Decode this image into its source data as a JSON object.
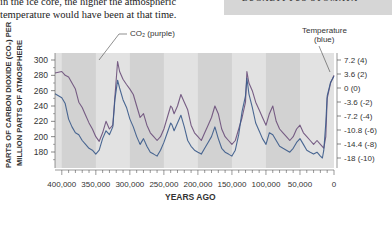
{
  "caption": {
    "line1": "in the ice core, the higher the atmospheric",
    "line2": "temperature would have been at that time."
  },
  "sidebar_label": "EUCALYPTUS STOMATA",
  "chart_data": {
    "type": "line",
    "title": "",
    "xlabel": "YEARS AGO",
    "ylabel": "PARTS OF CARBON DIOXIDE (CO2) PER MILLION PARTS OF ATMOSPHERE",
    "ylabel_line1": "PARTS OF CARBON DIOXIDE (CO₂) PER",
    "ylabel_line2": "MILLION PARTS OF ATMOSPHERE",
    "x_ticks": [
      "400,000",
      "350,000",
      "300,000",
      "250,000",
      "200,000",
      "150,000",
      "100,000",
      "50,000",
      "0"
    ],
    "x_range": [
      410000,
      0
    ],
    "y_left_ticks": [
      "300",
      "280",
      "260",
      "240",
      "220",
      "200",
      "180"
    ],
    "y_left_range": [
      177,
      303
    ],
    "y_right_ticks": [
      "7.2 (4)",
      "3.6 (2)",
      "0 (0)",
      "-3.6 (-2)",
      "-7.2 (-4)",
      "-10.8 (-6)",
      "-14.4 (-8)",
      "-18 (-10)"
    ],
    "y_right_label": "Temperature change °F (°C)",
    "grid": false,
    "background_bands": "alternating gray vertical bands every 50,000 years",
    "annotations": [
      {
        "text": "CO₂ (purple)",
        "points_to_x": 325000,
        "points_to_y": 300
      },
      {
        "text": "Temperature",
        "text2": "(blue)",
        "points_to_x": 5000,
        "points_to_y": 3.0
      }
    ],
    "series": [
      {
        "name": "CO2 (purple)",
        "axis": "left",
        "color": "#6b4f7a",
        "x": [
          410000,
          400000,
          395000,
          390000,
          385000,
          380000,
          375000,
          370000,
          365000,
          360000,
          355000,
          350000,
          345000,
          340000,
          335000,
          330000,
          325000,
          322000,
          318000,
          315000,
          310000,
          305000,
          300000,
          295000,
          290000,
          285000,
          280000,
          275000,
          270000,
          265000,
          260000,
          255000,
          250000,
          245000,
          240000,
          238000,
          235000,
          230000,
          225000,
          220000,
          215000,
          210000,
          205000,
          200000,
          195000,
          190000,
          185000,
          180000,
          175000,
          170000,
          165000,
          160000,
          155000,
          150000,
          145000,
          140000,
          135000,
          130000,
          128000,
          125000,
          120000,
          115000,
          110000,
          105000,
          100000,
          95000,
          90000,
          85000,
          80000,
          75000,
          70000,
          65000,
          60000,
          55000,
          50000,
          45000,
          40000,
          35000,
          30000,
          25000,
          20000,
          17000,
          15000,
          12000,
          10000,
          5000,
          0
        ],
        "values": [
          283,
          285,
          280,
          278,
          270,
          262,
          245,
          238,
          228,
          218,
          210,
          200,
          194,
          205,
          220,
          210,
          215,
          252,
          298,
          285,
          275,
          268,
          262,
          255,
          240,
          225,
          230,
          215,
          205,
          200,
          195,
          200,
          210,
          225,
          240,
          238,
          230,
          240,
          255,
          245,
          235,
          215,
          205,
          200,
          195,
          205,
          215,
          225,
          240,
          230,
          210,
          200,
          195,
          190,
          195,
          210,
          225,
          245,
          285,
          270,
          260,
          245,
          235,
          225,
          215,
          230,
          240,
          220,
          210,
          205,
          200,
          195,
          200,
          210,
          215,
          205,
          200,
          195,
          190,
          195,
          190,
          187,
          185,
          200,
          250,
          270,
          280
        ]
      },
      {
        "name": "Temperature (blue)",
        "axis": "right",
        "color": "#3a5a8a",
        "x": [
          410000,
          400000,
          395000,
          390000,
          385000,
          380000,
          375000,
          370000,
          365000,
          360000,
          355000,
          350000,
          345000,
          340000,
          335000,
          330000,
          325000,
          322000,
          318000,
          315000,
          310000,
          305000,
          300000,
          295000,
          290000,
          285000,
          280000,
          275000,
          270000,
          265000,
          260000,
          255000,
          250000,
          245000,
          240000,
          238000,
          235000,
          230000,
          225000,
          220000,
          215000,
          210000,
          205000,
          200000,
          195000,
          190000,
          185000,
          180000,
          175000,
          170000,
          165000,
          160000,
          155000,
          150000,
          145000,
          140000,
          135000,
          130000,
          128000,
          125000,
          120000,
          115000,
          110000,
          105000,
          100000,
          95000,
          90000,
          85000,
          80000,
          75000,
          70000,
          65000,
          60000,
          55000,
          50000,
          45000,
          40000,
          35000,
          30000,
          25000,
          20000,
          17000,
          15000,
          12000,
          10000,
          5000,
          0
        ],
        "values": [
          -1.5,
          -2.5,
          -4.0,
          -8.0,
          -10.0,
          -11.5,
          -12.0,
          -13.5,
          -14.5,
          -15.5,
          -16.0,
          -17.0,
          -16.0,
          -13.0,
          -11.0,
          -12.0,
          -10.0,
          -3.0,
          2.0,
          0.0,
          -3.0,
          -5.0,
          -8.0,
          -10.0,
          -12.5,
          -14.5,
          -13.0,
          -15.0,
          -16.5,
          -17.0,
          -17.5,
          -16.0,
          -14.0,
          -11.5,
          -9.0,
          -9.5,
          -11.0,
          -9.0,
          -7.0,
          -10.0,
          -13.5,
          -15.0,
          -16.0,
          -16.5,
          -17.0,
          -15.5,
          -14.0,
          -12.5,
          -10.0,
          -13.0,
          -15.5,
          -16.5,
          -17.0,
          -17.5,
          -16.0,
          -12.0,
          -6.0,
          -2.0,
          2.5,
          -1.5,
          -5.0,
          -9.0,
          -11.0,
          -13.0,
          -14.5,
          -11.5,
          -12.0,
          -13.5,
          -15.0,
          -15.5,
          -16.0,
          -16.5,
          -15.5,
          -14.0,
          -13.0,
          -14.5,
          -16.0,
          -16.5,
          -17.0,
          -16.5,
          -17.5,
          -18.0,
          -16.0,
          -9.0,
          -2.0,
          1.5,
          3.0
        ]
      }
    ]
  }
}
